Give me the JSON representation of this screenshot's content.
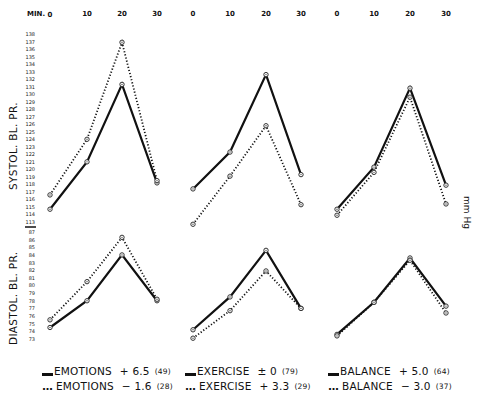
{
  "x_axis": {
    "label": "MIN.",
    "ticks": [
      "0",
      "10",
      "20",
      "30"
    ]
  },
  "y_axis": {
    "unit": "mm Hg",
    "systolic": {
      "label": "SYSTOL. BL. PR.",
      "ticks": [
        "113",
        "114",
        "115",
        "116",
        "117",
        "118",
        "119",
        "120",
        "121",
        "122",
        "123",
        "124",
        "125",
        "126",
        "127",
        "128",
        "129",
        "130",
        "131",
        "132",
        "133",
        "134",
        "135",
        "136",
        "137",
        "138"
      ]
    },
    "diastolic": {
      "label": "DIASTOL. BL. PR.",
      "ticks": [
        "73",
        "74",
        "75",
        "76",
        "77",
        "78",
        "79",
        "80",
        "81",
        "82",
        "83",
        "84",
        "85",
        "86",
        "87"
      ]
    }
  },
  "legend": [
    {
      "panel": "emotions",
      "solid": {
        "name": "EMOTIONS",
        "value": "+ 6.5",
        "n": "(49)"
      },
      "dotted": {
        "name": "EMOTIONS",
        "value": "− 1.6",
        "n": "(28)"
      }
    },
    {
      "panel": "exercise",
      "solid": {
        "name": "EXERCISE",
        "value": "± 0",
        "n": "(79)"
      },
      "dotted": {
        "name": "EXERCISE",
        "value": "+ 3.3",
        "n": "(29)"
      }
    },
    {
      "panel": "balance",
      "solid": {
        "name": "BALANCE",
        "value": "+ 5.0",
        "n": "(64)"
      },
      "dotted": {
        "name": "BALANCE",
        "value": "− 3.0",
        "n": "(37)"
      }
    }
  ],
  "chart_data": {
    "type": "line",
    "title": "",
    "xlabel": "MIN.",
    "ylabel": "mm Hg",
    "x": [
      0,
      10,
      20,
      30
    ],
    "grid": false,
    "legend_position": "bottom",
    "panels": [
      {
        "name": "EMOTIONS",
        "systolic": {
          "ylim": [
            113,
            138
          ],
          "series": [
            {
              "name": "EMOTIONS + 6.5 (49)",
              "style": "solid",
              "values": [
                114.7,
                121.0,
                131.3,
                118.2
              ]
            },
            {
              "name": "EMOTIONS − 1.6 (28)",
              "style": "dotted",
              "values": [
                116.6,
                124.0,
                136.9,
                118.5
              ]
            }
          ]
        },
        "diastolic": {
          "ylim": [
            73,
            87
          ],
          "series": [
            {
              "name": "EMOTIONS + 6.5 (49)",
              "style": "solid",
              "values": [
                74.5,
                78.0,
                84.0,
                78.0
              ]
            },
            {
              "name": "EMOTIONS − 1.6 (28)",
              "style": "dotted",
              "values": [
                75.5,
                80.5,
                86.3,
                78.2
              ]
            }
          ]
        }
      },
      {
        "name": "EXERCISE",
        "systolic": {
          "ylim": [
            113,
            138
          ],
          "series": [
            {
              "name": "EXERCISE ± 0 (79)",
              "style": "solid",
              "values": [
                117.4,
                122.3,
                132.6,
                119.3
              ]
            },
            {
              "name": "EXERCISE + 3.3 (29)",
              "style": "dotted",
              "values": [
                112.7,
                119.1,
                125.8,
                115.3
              ]
            }
          ]
        },
        "diastolic": {
          "ylim": [
            73,
            87
          ],
          "series": [
            {
              "name": "EXERCISE ± 0 (79)",
              "style": "solid",
              "values": [
                74.2,
                78.5,
                84.6,
                77.0
              ]
            },
            {
              "name": "EXERCISE + 3.3 (29)",
              "style": "dotted",
              "values": [
                73.1,
                76.7,
                81.9,
                77.0
              ]
            }
          ]
        }
      },
      {
        "name": "BALANCE",
        "systolic": {
          "ylim": [
            113,
            138
          ],
          "series": [
            {
              "name": "BALANCE + 5.0 (64)",
              "style": "solid",
              "values": [
                114.7,
                120.3,
                130.8,
                117.9
              ]
            },
            {
              "name": "BALANCE − 3.0 (37)",
              "style": "dotted",
              "values": [
                113.9,
                119.6,
                129.6,
                115.4
              ]
            }
          ]
        },
        "diastolic": {
          "ylim": [
            73,
            87
          ],
          "series": [
            {
              "name": "BALANCE + 5.0 (64)",
              "style": "solid",
              "values": [
                73.6,
                77.8,
                83.6,
                77.3
              ]
            },
            {
              "name": "BALANCE − 3.0 (37)",
              "style": "dotted",
              "values": [
                73.4,
                77.8,
                83.3,
                76.4
              ]
            }
          ]
        }
      }
    ]
  }
}
